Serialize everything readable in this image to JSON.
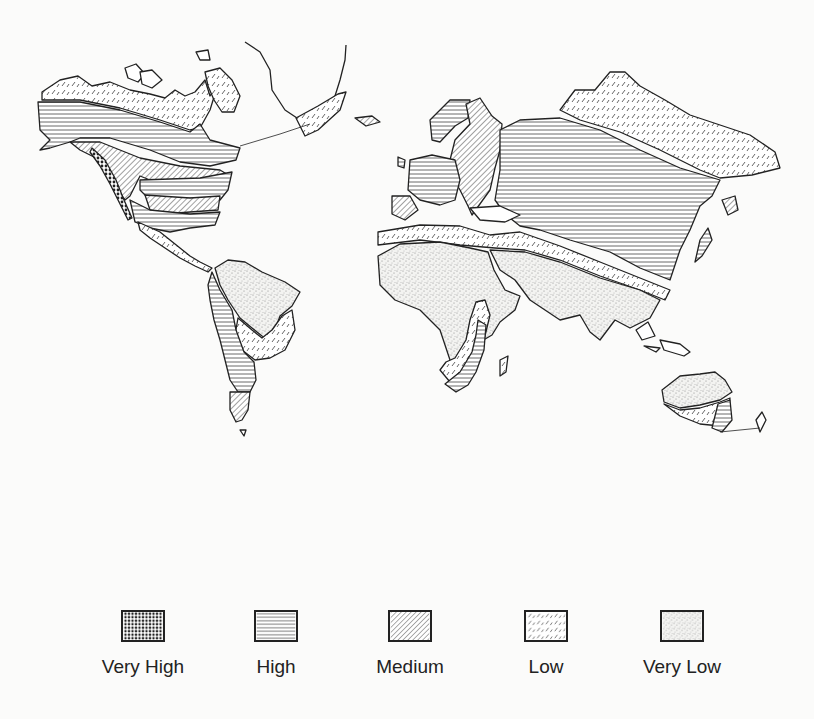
{
  "map": {
    "type": "world-choropleth",
    "projection": "world outline (continents)",
    "line_color": "#222222",
    "background": "#fbfbfa"
  },
  "legend": {
    "items": [
      {
        "label": "Very High",
        "pattern": "dense-dots",
        "color": "#222222"
      },
      {
        "label": "High",
        "pattern": "horizontal-lines",
        "color": "#555555"
      },
      {
        "label": "Medium",
        "pattern": "diagonal-lines",
        "color": "#555555"
      },
      {
        "label": "Low",
        "pattern": "sparse-dashes",
        "color": "#777777"
      },
      {
        "label": "Very Low",
        "pattern": "stipple",
        "color": "#999999"
      }
    ]
  },
  "regions": [
    {
      "name": "Northern Canada / Alaska north",
      "category": "Low"
    },
    {
      "name": "Canada / Alaska central",
      "category": "High"
    },
    {
      "name": "US Pacific coast",
      "category": "Very High"
    },
    {
      "name": "Western/Central US",
      "category": "Medium"
    },
    {
      "name": "Central / Southern US",
      "category": "High"
    },
    {
      "name": "Greenland south",
      "category": "Low"
    },
    {
      "name": "Northern South America",
      "category": "Very Low"
    },
    {
      "name": "Southern Brazil",
      "category": "Low"
    },
    {
      "name": "Andes / West South America",
      "category": "High"
    },
    {
      "name": "Patagonia",
      "category": "Medium"
    },
    {
      "name": "Western Europe",
      "category": "High"
    },
    {
      "name": "Scandinavia / Eastern Europe",
      "category": "Medium"
    },
    {
      "name": "Siberia north",
      "category": "Low"
    },
    {
      "name": "Russia / Central Asia / China",
      "category": "High"
    },
    {
      "name": "Central Asia belt",
      "category": "Low"
    },
    {
      "name": "Africa north and central",
      "category": "Very Low"
    },
    {
      "name": "East Africa",
      "category": "Low"
    },
    {
      "name": "Southern Africa",
      "category": "High"
    },
    {
      "name": "Middle East / South Asia",
      "category": "Very Low"
    },
    {
      "name": "Australia interior",
      "category": "Very Low"
    },
    {
      "name": "Australia south-east",
      "category": "Low"
    }
  ]
}
